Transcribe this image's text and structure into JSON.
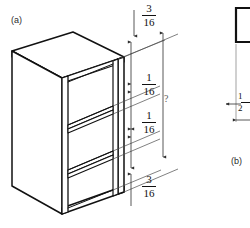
{
  "figure": {
    "type": "isometric-engineering-drawing",
    "background_color": "#ffffff",
    "line_color": "#111111",
    "dimension_line_color": "#4a4a4a",
    "panels": [
      {
        "id": "a",
        "label": "(a)",
        "description": "isometric view of cabinet with vertical dimension stack"
      },
      {
        "id": "b",
        "label": "(b)",
        "description": "partial detail view with material thickness dimension"
      }
    ]
  },
  "panel_a": {
    "label": "(a)",
    "dimensions": [
      {
        "id": "top-gap",
        "numerator": "3",
        "denominator": "16",
        "role": "top panel thickness / top clearance"
      },
      {
        "id": "shelf-1",
        "numerator": "1",
        "denominator": "16",
        "role": "upper shelf thickness"
      },
      {
        "id": "shelf-2",
        "numerator": "1",
        "denominator": "16",
        "role": "lower shelf thickness"
      },
      {
        "id": "bottom-gap",
        "numerator": "3",
        "denominator": "16",
        "role": "bottom panel thickness / base clearance"
      }
    ],
    "overall_dimension": {
      "id": "overall-height",
      "value": "?",
      "role": "total interior height, unknown"
    }
  },
  "panel_b": {
    "label": "(b)",
    "dimensions": [
      {
        "id": "wall-thickness",
        "numerator": "1",
        "denominator": "2",
        "role": "panel thickness detail"
      }
    ]
  }
}
